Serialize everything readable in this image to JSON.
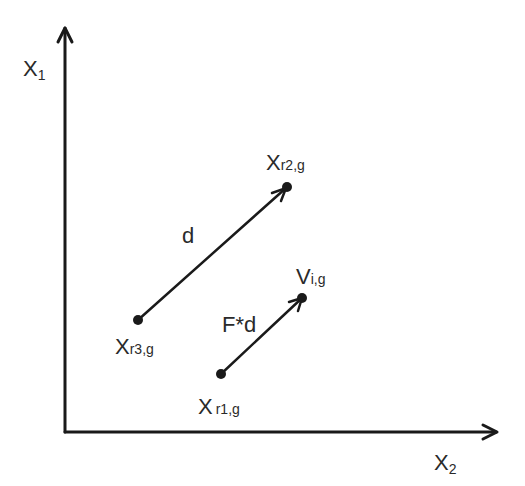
{
  "diagram": {
    "type": "vector-diagram",
    "axes": {
      "y_axis_label": "X",
      "y_axis_sub": "1",
      "x_axis_label": "X",
      "x_axis_sub": "2"
    },
    "points": [
      {
        "id": "xr1",
        "label": "X",
        "sub": "r1,g"
      },
      {
        "id": "xr2",
        "label": "X",
        "sub": "r2,g"
      },
      {
        "id": "xr3",
        "label": "X",
        "sub": "r3,g"
      },
      {
        "id": "vi",
        "label": "V",
        "sub": "i,g"
      }
    ],
    "vectors": [
      {
        "id": "d",
        "label": "d",
        "from": "xr3",
        "to": "xr2"
      },
      {
        "id": "fd",
        "label": "F*d",
        "from": "xr1",
        "to": "vi"
      }
    ],
    "colors": {
      "ink": "#1a1a1a",
      "background": "#ffffff"
    }
  }
}
